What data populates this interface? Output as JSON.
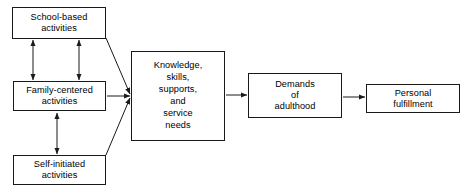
{
  "diagram": {
    "type": "flow-diagram",
    "background_color": "#ffffff",
    "line_color": "#1a1a1a",
    "text_color": "#000000",
    "nodes": [
      {
        "id": "school",
        "label": "School-based\nactivities"
      },
      {
        "id": "family",
        "label": "Family-centered\nactivities"
      },
      {
        "id": "self",
        "label": "Self-initiated\nactivities"
      },
      {
        "id": "knowledge",
        "label": "Knowledge,\nskills,\nsupports,\nand\nservice\nneeds"
      },
      {
        "id": "demands",
        "label": "Demands\nof\nadulthood"
      },
      {
        "id": "personal",
        "label": "Personal\nfulfillment"
      }
    ],
    "edges": [
      {
        "id": "school-family-left",
        "from": "school",
        "to": "family",
        "style": "double-arrow-vertical"
      },
      {
        "id": "school-family-right",
        "from": "school",
        "to": "family",
        "style": "double-arrow-vertical"
      },
      {
        "id": "family-self",
        "from": "family",
        "to": "self",
        "style": "double-arrow-vertical"
      },
      {
        "id": "school-knowledge",
        "from": "school",
        "to": "knowledge",
        "style": "single-arrow-diagonal"
      },
      {
        "id": "family-knowledge",
        "from": "family",
        "to": "knowledge",
        "style": "single-arrow-horizontal"
      },
      {
        "id": "self-knowledge",
        "from": "self",
        "to": "knowledge",
        "style": "single-arrow-diagonal"
      },
      {
        "id": "knowledge-demands",
        "from": "knowledge",
        "to": "demands",
        "style": "single-arrow-horizontal"
      },
      {
        "id": "demands-personal",
        "from": "demands",
        "to": "personal",
        "style": "single-arrow-horizontal"
      }
    ]
  }
}
